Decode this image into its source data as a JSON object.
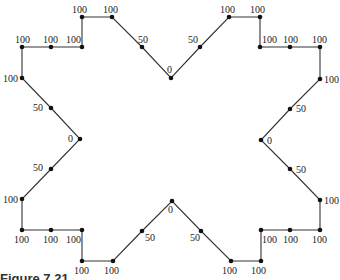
{
  "diagram": {
    "type": "polygon-with-weighted-vertices",
    "stroke_color": "#333333",
    "point_color": "#111111",
    "vertices": [
      {
        "x": 82,
        "y": 17,
        "label": "100",
        "lx": 72,
        "ly": 13
      },
      {
        "x": 112,
        "y": 17,
        "label": "100",
        "lx": 103,
        "ly": 13
      },
      {
        "x": 142,
        "y": 47,
        "label": "50",
        "lx": 138,
        "ly": 43
      },
      {
        "x": 171,
        "y": 78,
        "label": "0",
        "lx": 167,
        "ly": 73
      },
      {
        "x": 200,
        "y": 47,
        "label": "50",
        "lx": 188,
        "ly": 43
      },
      {
        "x": 229,
        "y": 17,
        "label": "100",
        "lx": 220,
        "ly": 13
      },
      {
        "x": 260,
        "y": 17,
        "label": "100",
        "lx": 250,
        "ly": 13
      },
      {
        "x": 260,
        "y": 47,
        "label": "100",
        "lx": 262,
        "ly": 43
      },
      {
        "x": 290,
        "y": 47,
        "label": "100",
        "lx": 283,
        "ly": 43
      },
      {
        "x": 320,
        "y": 47,
        "label": "100",
        "lx": 312,
        "ly": 43
      },
      {
        "x": 320,
        "y": 79,
        "label": "100",
        "lx": 324,
        "ly": 83
      },
      {
        "x": 290,
        "y": 109,
        "label": "50",
        "lx": 296,
        "ly": 112
      },
      {
        "x": 261,
        "y": 140,
        "label": "0",
        "lx": 267,
        "ly": 144
      },
      {
        "x": 290,
        "y": 169,
        "label": "50",
        "lx": 296,
        "ly": 173
      },
      {
        "x": 320,
        "y": 200,
        "label": "100",
        "lx": 324,
        "ly": 204
      },
      {
        "x": 320,
        "y": 230,
        "label": "100",
        "lx": 312,
        "ly": 243
      },
      {
        "x": 290,
        "y": 230,
        "label": "100",
        "lx": 283,
        "ly": 243
      },
      {
        "x": 261,
        "y": 230,
        "label": "100",
        "lx": 262,
        "ly": 243
      },
      {
        "x": 261,
        "y": 261,
        "label": "100",
        "lx": 251,
        "ly": 274
      },
      {
        "x": 231,
        "y": 261,
        "label": "100",
        "lx": 222,
        "ly": 274
      },
      {
        "x": 201,
        "y": 231,
        "label": "50",
        "lx": 190,
        "ly": 241
      },
      {
        "x": 172,
        "y": 201,
        "label": "0",
        "lx": 168,
        "ly": 213
      },
      {
        "x": 142,
        "y": 231,
        "label": "50",
        "lx": 145,
        "ly": 241
      },
      {
        "x": 113,
        "y": 261,
        "label": "100",
        "lx": 104,
        "ly": 274
      },
      {
        "x": 82,
        "y": 261,
        "label": "100",
        "lx": 74,
        "ly": 274
      },
      {
        "x": 82,
        "y": 230,
        "label": "100",
        "lx": 66,
        "ly": 243
      },
      {
        "x": 51,
        "y": 230,
        "label": "100",
        "lx": 43,
        "ly": 243
      },
      {
        "x": 22,
        "y": 230,
        "label": "100",
        "lx": 14,
        "ly": 243
      },
      {
        "x": 22,
        "y": 199,
        "label": "100",
        "lx": 3,
        "ly": 203
      },
      {
        "x": 51,
        "y": 169,
        "label": "50",
        "lx": 33,
        "ly": 171
      },
      {
        "x": 80,
        "y": 139,
        "label": "0",
        "lx": 68,
        "ly": 142
      },
      {
        "x": 51,
        "y": 108,
        "label": "50",
        "lx": 33,
        "ly": 111
      },
      {
        "x": 22,
        "y": 78,
        "label": "100",
        "lx": 3,
        "ly": 82
      },
      {
        "x": 22,
        "y": 47,
        "label": "100",
        "lx": 15,
        "ly": 43
      },
      {
        "x": 51,
        "y": 47,
        "label": "100",
        "lx": 43,
        "ly": 43
      },
      {
        "x": 82,
        "y": 47,
        "label": "100",
        "lx": 66,
        "ly": 43
      }
    ]
  },
  "caption": "Figure 7.21"
}
